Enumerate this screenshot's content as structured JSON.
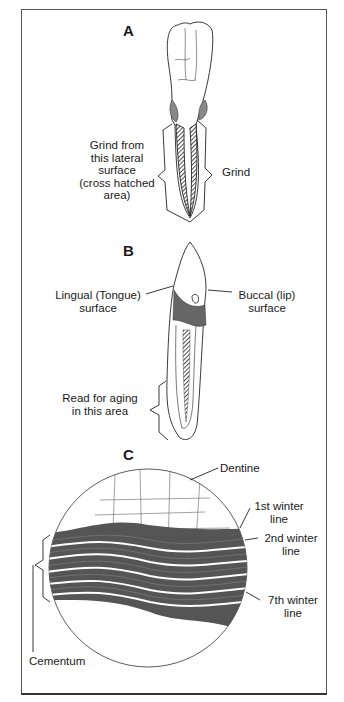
{
  "figure": {
    "panels": [
      {
        "letter": "A",
        "labels": {
          "left": [
            "Grind from",
            "this lateral",
            "surface",
            "(cross hatched",
            "area)"
          ],
          "right": "Grind"
        }
      },
      {
        "letter": "B",
        "labels": {
          "lingual": [
            "Lingual (Tongue)",
            "surface"
          ],
          "buccal": [
            "Buccal (lip)",
            "surface"
          ],
          "read": [
            "Read for aging",
            "in this area"
          ]
        }
      },
      {
        "letter": "C",
        "labels": {
          "dentine": "Dentine",
          "winter1": [
            "1st winter",
            "line"
          ],
          "winter2": [
            "2nd winter",
            "line"
          ],
          "winter7": [
            "7th winter",
            "line"
          ],
          "cementum": "Cementum"
        }
      }
    ],
    "colors": {
      "ink": "#1a1a1a",
      "frame": "#555555",
      "background": "#ffffff"
    }
  }
}
